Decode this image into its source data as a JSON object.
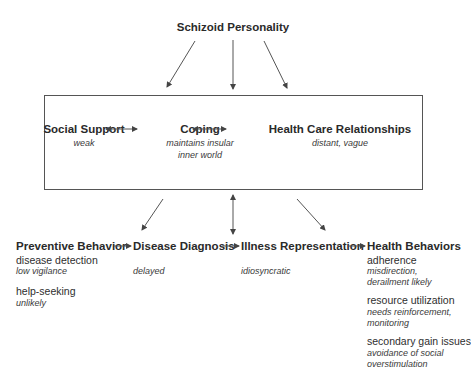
{
  "top": {
    "title": "Schizoid Personality"
  },
  "box": {
    "social_support": {
      "title": "Social Support",
      "note": "weak"
    },
    "coping": {
      "title": "Coping",
      "note_line1": "maintains insular",
      "note_line2": "inner world"
    },
    "health_care": {
      "title": "Health Care Relationships",
      "note": "distant, vague"
    }
  },
  "bottom": {
    "preventive": {
      "title": "Preventive Behavior",
      "items": [
        {
          "label": "disease detection",
          "note": "low vigilance"
        },
        {
          "label": "help-seeking",
          "note": "unlikely"
        }
      ]
    },
    "diagnosis": {
      "title": "Disease Diagnosis",
      "note": "delayed"
    },
    "illness": {
      "title": "Illness Representation",
      "note": "idiosyncratic"
    },
    "health_behaviors": {
      "title": "Health Behaviors",
      "items": [
        {
          "label": "adherence",
          "note_line1": "misdirection,",
          "note_line2": "derailment likely"
        },
        {
          "label": "resource utilization",
          "note_line1": "needs reinforcement,",
          "note_line2": "monitoring"
        },
        {
          "label": "secondary gain issues",
          "note_line1": "avoidance of social",
          "note_line2": "overstimulation"
        }
      ]
    }
  },
  "colors": {
    "text": "#2a2a2a",
    "line": "#555555"
  }
}
